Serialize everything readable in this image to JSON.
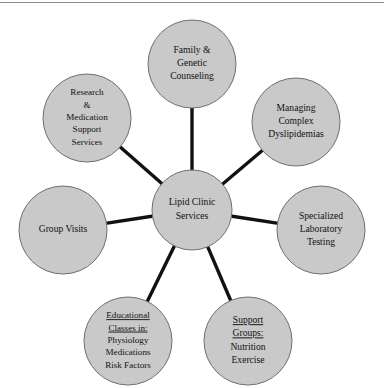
{
  "figure": {
    "kind": "hub-and-spoke-diagram",
    "title_text": "Lipid Clinic Services",
    "colors": {
      "node_fill": "#c9c9c9",
      "node_stroke": "#6f6f6f",
      "spoke_stroke": "#111111",
      "text": "#111111",
      "background": "#ffffff",
      "top_rule": "#8c8c90"
    }
  },
  "chart_data": {
    "type": "diagram",
    "center": {
      "id": "hub",
      "lines": [
        "Lipid Clinic",
        "Services"
      ],
      "cx": 192,
      "cy": 210,
      "r": 40
    },
    "nodes": [
      {
        "id": "family-genetic-counseling",
        "lines": [
          "Family &",
          "Genetic",
          "Counseling"
        ],
        "underlined_lines": 0,
        "cx": 192,
        "cy": 64,
        "r": 44
      },
      {
        "id": "managing-complex-dyslipidemias",
        "lines": [
          "Managing",
          "Complex",
          "Dyslipidemias"
        ],
        "underlined_lines": 0,
        "cx": 296,
        "cy": 122,
        "r": 44
      },
      {
        "id": "specialized-laboratory-testing",
        "lines": [
          "Specialized",
          "Laboratory",
          "Testing"
        ],
        "underlined_lines": 0,
        "cx": 321,
        "cy": 230,
        "r": 44
      },
      {
        "id": "support-groups",
        "lines": [
          "Support",
          "Groups:",
          "Nutrition",
          "Exercise"
        ],
        "underlined_lines": 2,
        "cx": 248,
        "cy": 341,
        "r": 44
      },
      {
        "id": "educational-classes",
        "lines": [
          "Educational",
          "Classes in:",
          "Physiology",
          "Medications",
          "Risk Factors"
        ],
        "underlined_lines": 2,
        "cx": 128,
        "cy": 341,
        "r": 44
      },
      {
        "id": "group-visits",
        "lines": [
          "Group Visits"
        ],
        "underlined_lines": 0,
        "cx": 63,
        "cy": 230,
        "r": 44
      },
      {
        "id": "research-medication-support-services",
        "lines": [
          "Research",
          "&",
          "Medication",
          "Support",
          "Services"
        ],
        "underlined_lines": 0,
        "cx": 87,
        "cy": 118,
        "r": 44
      }
    ],
    "edges": [
      {
        "from": "hub",
        "to": "family-genetic-counseling"
      },
      {
        "from": "hub",
        "to": "managing-complex-dyslipidemias"
      },
      {
        "from": "hub",
        "to": "specialized-laboratory-testing"
      },
      {
        "from": "hub",
        "to": "support-groups"
      },
      {
        "from": "hub",
        "to": "educational-classes"
      },
      {
        "from": "hub",
        "to": "group-visits"
      },
      {
        "from": "hub",
        "to": "research-medication-support-services"
      }
    ],
    "legend": [],
    "xlabel": "",
    "ylabel": ""
  }
}
